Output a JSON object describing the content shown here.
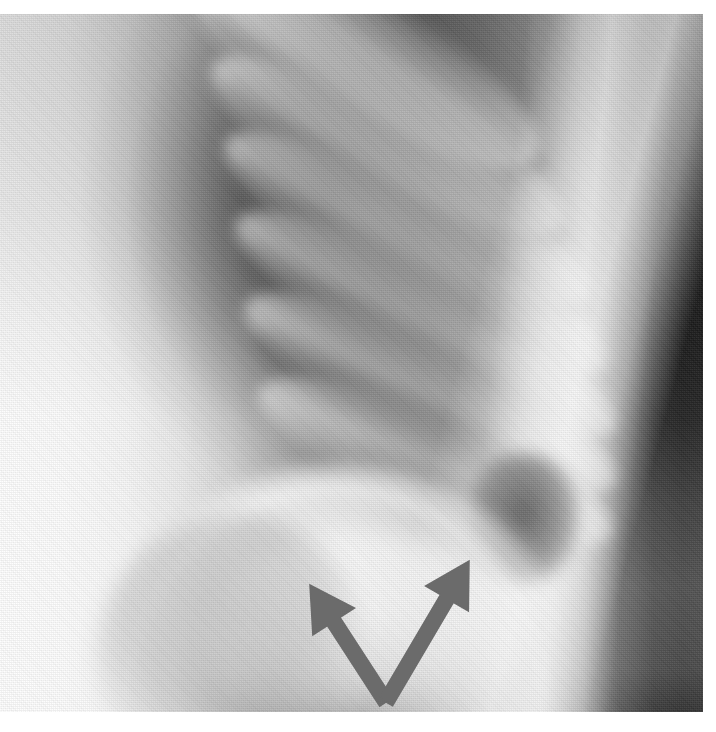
{
  "figure": {
    "kind": "radiograph",
    "modality": "x-ray",
    "view": "chest, coned-down oblique view of right hemithorax",
    "title": "",
    "caption": "",
    "width": 716,
    "height": 732
  },
  "plate": {
    "name": "radiograph-plate",
    "left": 0,
    "top": 14,
    "width": 703,
    "height": 698,
    "background_hex": "#b9b9b9",
    "margin_hex": "#ffffff",
    "grain": "halftone-print-screen"
  },
  "tones": {
    "film_white_hex": "#fbfbfb",
    "soft_tissue_hex": "#d8d8d8",
    "mid_gray_hex": "#8a8a8a",
    "lung_field_hex": "#3a3a3a",
    "deep_black_hex": "#1b1b1b"
  },
  "anatomy": {
    "regions": [
      {
        "name": "chest-wall-soft-tissue",
        "label": "chest wall / soft tissue",
        "side": "left",
        "tone": "bright"
      },
      {
        "name": "lung-field",
        "label": "lung field",
        "side": "upper-centre",
        "tone": "dark"
      },
      {
        "name": "rib-cage",
        "label": "ribs",
        "orientation": "oblique, upper-left to lower-right",
        "tone": "bright bands"
      },
      {
        "name": "posterior-bright-band",
        "label": "paraspinal / posterior band",
        "side": "right",
        "tone": "bright"
      },
      {
        "name": "hemidiaphragm",
        "label": "hemidiaphragm dome",
        "side": "lower-centre",
        "tone": "bright"
      },
      {
        "name": "subdiaphragmatic-region",
        "label": "subdiaphragmatic region",
        "side": "lower-centre",
        "tone": "bright"
      },
      {
        "name": "costophrenic-recess",
        "label": "costophrenic recess",
        "side": "lower-right",
        "tone": "dark"
      }
    ],
    "ribs": [
      {
        "name": "rib-1",
        "left": 150,
        "top": -30,
        "width": 420,
        "height": 120,
        "rotate": 33
      },
      {
        "name": "rib-2",
        "left": 165,
        "top": 40,
        "width": 430,
        "height": 112,
        "rotate": 33
      },
      {
        "name": "rib-3",
        "left": 180,
        "top": 112,
        "width": 440,
        "height": 110,
        "rotate": 32
      },
      {
        "name": "rib-4",
        "left": 195,
        "top": 186,
        "width": 440,
        "height": 108,
        "rotate": 31
      },
      {
        "name": "rib-5",
        "left": 210,
        "top": 258,
        "width": 430,
        "height": 106,
        "rotate": 29
      },
      {
        "name": "rib-6",
        "left": 225,
        "top": 328,
        "width": 410,
        "height": 104,
        "rotate": 26
      },
      {
        "name": "rib-7",
        "left": 245,
        "top": 398,
        "width": 380,
        "height": 100,
        "rotate": 22
      }
    ],
    "rib_interspaces": [
      {
        "name": "interspace-1",
        "left": 160,
        "top": 6,
        "width": 420,
        "height": 70,
        "rotate": 33
      },
      {
        "name": "interspace-2",
        "left": 175,
        "top": 78,
        "width": 430,
        "height": 70,
        "rotate": 33
      },
      {
        "name": "interspace-3",
        "left": 190,
        "top": 150,
        "width": 440,
        "height": 70,
        "rotate": 32
      },
      {
        "name": "interspace-4",
        "left": 205,
        "top": 224,
        "width": 435,
        "height": 70,
        "rotate": 30
      },
      {
        "name": "interspace-5",
        "left": 220,
        "top": 296,
        "width": 420,
        "height": 70,
        "rotate": 28
      },
      {
        "name": "interspace-6",
        "left": 238,
        "top": 366,
        "width": 395,
        "height": 68,
        "rotate": 24
      }
    ]
  },
  "annotation": {
    "name": "double-arrow-marker",
    "shape": "V",
    "label": "",
    "color_hex": "#6b6b6b",
    "stroke_width": 15,
    "arrows": [
      {
        "name": "left-arrow",
        "direction": "up-left",
        "tail_x": 386,
        "tail_y": 702,
        "tip_x": 310,
        "tip_y": 585,
        "points_at": "subdiaphragmatic-region"
      },
      {
        "name": "right-arrow",
        "direction": "up-right",
        "tail_x": 386,
        "tail_y": 702,
        "tip_x": 469,
        "tip_y": 561,
        "points_at": "hemidiaphragm"
      }
    ],
    "vertex_x": 386,
    "vertex_y": 703
  }
}
